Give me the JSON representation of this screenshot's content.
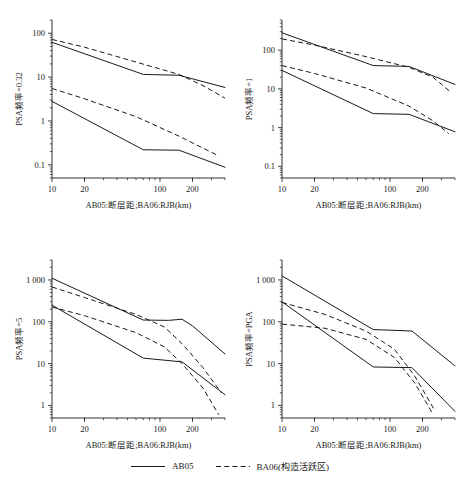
{
  "figure": {
    "xlabel": "AB05:断层距;BA06:RJB(km)",
    "x_ticks": [
      "10",
      "20",
      "100",
      "200"
    ],
    "x_tick_values": [
      10,
      20,
      100,
      200
    ],
    "xlim": [
      10,
      400
    ],
    "legend": [
      {
        "label": "AB05",
        "style": "solid"
      },
      {
        "label": "BA06(构造活跃区)",
        "style": "dashed"
      }
    ]
  },
  "chart_data": [
    {
      "type": "line",
      "title": "",
      "ylabel": "PSA频率=0.32",
      "xlabel": "AB05:断层距;BA06:RJB(km)",
      "xscale": "log",
      "yscale": "log",
      "xlim": [
        10,
        400
      ],
      "ylim": [
        0.05,
        200
      ],
      "x_ticks": [
        10,
        20,
        100,
        200
      ],
      "x_ticklabels": [
        "10",
        "20",
        "100",
        "200"
      ],
      "y_ticks": [
        0.1,
        1,
        10,
        100
      ],
      "y_ticklabels": [
        "0.1",
        "1",
        "10",
        "100"
      ],
      "grid": false,
      "series": [
        {
          "name": "AB05 upper",
          "style": "solid",
          "x": [
            10,
            70,
            150,
            400
          ],
          "y": [
            62,
            11.5,
            11.0,
            5.8
          ]
        },
        {
          "name": "BA06 upper",
          "style": "dashed",
          "x": [
            10,
            20,
            60,
            150,
            250,
            400
          ],
          "y": [
            72,
            48,
            22,
            11.5,
            6.4,
            3.3
          ]
        },
        {
          "name": "AB05 lower",
          "style": "solid",
          "x": [
            10,
            70,
            150,
            400
          ],
          "y": [
            2.8,
            0.22,
            0.215,
            0.088
          ]
        },
        {
          "name": "BA06 lower",
          "style": "dashed",
          "x": [
            10,
            20,
            60,
            150,
            250,
            350
          ],
          "y": [
            5.5,
            3.2,
            1.25,
            0.45,
            0.24,
            0.16
          ]
        }
      ]
    },
    {
      "type": "line",
      "title": "",
      "ylabel": "PSA频率=1",
      "xlabel": "AB05:断层距;BA06:RJB(km)",
      "xscale": "log",
      "yscale": "log",
      "xlim": [
        10,
        400
      ],
      "ylim": [
        0.05,
        600
      ],
      "x_ticks": [
        10,
        20,
        100,
        200
      ],
      "x_ticklabels": [
        "10",
        "20",
        "100",
        "200"
      ],
      "y_ticks": [
        0.1,
        1,
        10,
        100
      ],
      "y_ticklabels": [
        "0.1",
        "1",
        "10",
        "100"
      ],
      "grid": false,
      "series": [
        {
          "name": "AB05 upper",
          "style": "solid",
          "x": [
            10,
            70,
            150,
            400
          ],
          "y": [
            280,
            40,
            38,
            13
          ]
        },
        {
          "name": "BA06 upper",
          "style": "dashed",
          "x": [
            10,
            20,
            60,
            150,
            250,
            370
          ],
          "y": [
            195,
            135,
            68,
            36,
            20,
            8.0
          ]
        },
        {
          "name": "AB05 lower",
          "style": "solid",
          "x": [
            10,
            70,
            150,
            400
          ],
          "y": [
            30,
            2.3,
            2.2,
            0.78
          ]
        },
        {
          "name": "BA06 lower",
          "style": "dashed",
          "x": [
            10,
            20,
            60,
            150,
            250,
            350
          ],
          "y": [
            40,
            25,
            10.5,
            3.6,
            1.5,
            0.7
          ]
        }
      ]
    },
    {
      "type": "line",
      "title": "",
      "ylabel": "PSA频率=5",
      "xlabel": "AB05:断层距;BA06:RJB(km)",
      "xscale": "log",
      "yscale": "log",
      "xlim": [
        10,
        400
      ],
      "ylim": [
        0.5,
        3000
      ],
      "x_ticks": [
        10,
        20,
        100,
        200
      ],
      "x_ticklabels": [
        "10",
        "20",
        "100",
        "200"
      ],
      "y_ticks": [
        1,
        10,
        100,
        1000
      ],
      "y_ticklabels": [
        "1",
        "10",
        "100",
        "1 000"
      ],
      "grid": false,
      "series": [
        {
          "name": "AB05 upper",
          "style": "solid",
          "x": [
            10,
            70,
            120,
            160,
            200,
            400
          ],
          "y": [
            1100,
            110,
            108,
            115,
            80,
            17
          ]
        },
        {
          "name": "BA06 upper",
          "style": "dashed",
          "x": [
            10,
            20,
            60,
            110,
            160,
            250,
            370
          ],
          "y": [
            680,
            380,
            150,
            75,
            30,
            8,
            2.0
          ]
        },
        {
          "name": "AB05 lower",
          "style": "solid",
          "x": [
            10,
            70,
            160,
            400
          ],
          "y": [
            250,
            13.5,
            11,
            1.8
          ]
        },
        {
          "name": "BA06 lower",
          "style": "dashed",
          "x": [
            10,
            20,
            60,
            110,
            160,
            250,
            350
          ],
          "y": [
            225,
            140,
            55,
            25,
            10,
            2.6,
            0.6
          ]
        }
      ]
    },
    {
      "type": "line",
      "title": "",
      "ylabel": "PSA频率=PGA",
      "xlabel": "AB05:断层距;BA06:RJB(km)",
      "xscale": "log",
      "yscale": "log",
      "xlim": [
        10,
        400
      ],
      "ylim": [
        0.5,
        3000
      ],
      "x_ticks": [
        10,
        20,
        100,
        200
      ],
      "x_ticklabels": [
        "10",
        "20",
        "100",
        "200"
      ],
      "y_ticks": [
        1,
        10,
        100,
        1000
      ],
      "y_ticklabels": [
        "1",
        "10",
        "100",
        "1 000"
      ],
      "grid": false,
      "series": [
        {
          "name": "AB05 upper",
          "style": "solid",
          "x": [
            10,
            70,
            100,
            160,
            400
          ],
          "y": [
            1250,
            65,
            63,
            60,
            8.8
          ]
        },
        {
          "name": "BA06 upper",
          "style": "dashed",
          "x": [
            10,
            25,
            60,
            110,
            170,
            260
          ],
          "y": [
            290,
            150,
            60,
            22,
            5.0,
            0.75
          ]
        },
        {
          "name": "AB05 lower",
          "style": "solid",
          "x": [
            10,
            70,
            160,
            400
          ],
          "y": [
            300,
            8.3,
            8.0,
            0.72
          ]
        },
        {
          "name": "BA06 lower",
          "style": "dashed",
          "x": [
            10,
            25,
            60,
            110,
            170,
            250
          ],
          "y": [
            88,
            70,
            38,
            14,
            3.4,
            0.62
          ]
        }
      ]
    }
  ]
}
